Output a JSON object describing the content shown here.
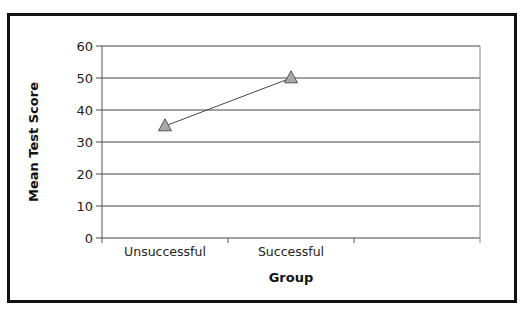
{
  "chart_data": {
    "type": "line",
    "title": "",
    "xlabel": "Group",
    "ylabel": "Mean Test Score",
    "categories": [
      "Unsuccessful",
      "Successful",
      ""
    ],
    "series": [
      {
        "name": "Mean Test Score",
        "marker": "triangle",
        "values": [
          35,
          50,
          null
        ]
      }
    ],
    "ylim": [
      0,
      60
    ],
    "yticks": [
      0,
      10,
      20,
      30,
      40,
      50,
      60
    ],
    "ytick_labels": [
      "0",
      "10",
      "20",
      "30",
      "40",
      "50",
      "60"
    ],
    "grid": {
      "horizontal": true,
      "vertical": false
    },
    "legend": null,
    "colors": {
      "marker_fill": "#a9a9a9",
      "marker_stroke": "#555555",
      "line": "#444444",
      "gridline": "#444444",
      "frame": "#111111"
    }
  }
}
